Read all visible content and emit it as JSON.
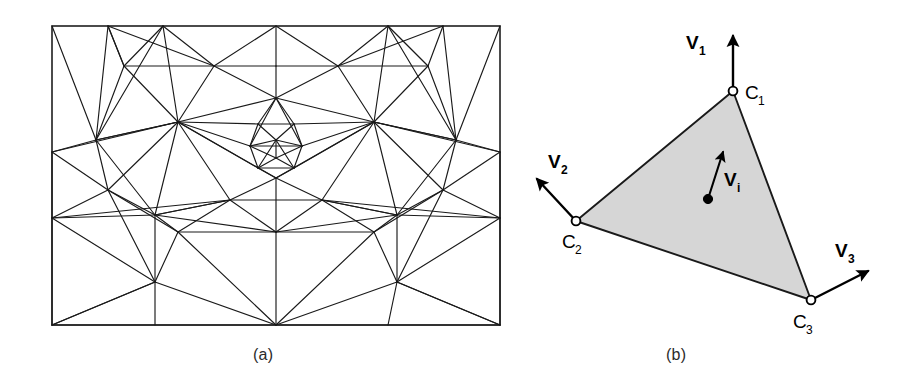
{
  "figure": {
    "background_color": "#ffffff",
    "line_color": "#1a1a1a",
    "fill_color": "#d6d6d6",
    "width": 913,
    "height": 380
  },
  "panel_a": {
    "caption": "(a)",
    "description": "adaptive triangular finite element mesh with refined central region",
    "border": {
      "x0": 52,
      "y0": 26,
      "x1": 500,
      "y1": 325
    },
    "mesh": {
      "type": "triangulation",
      "symmetry": "mirror about vertical center axis x=276",
      "nodes": [
        [
          52,
          26
        ],
        [
          108,
          26
        ],
        [
          163,
          26
        ],
        [
          276,
          26
        ],
        [
          388,
          26
        ],
        [
          443,
          26
        ],
        [
          500,
          26
        ],
        [
          124,
          66
        ],
        [
          214,
          66
        ],
        [
          276,
          66
        ],
        [
          338,
          66
        ],
        [
          428,
          66
        ],
        [
          52,
          152
        ],
        [
          96,
          140
        ],
        [
          178,
          122
        ],
        [
          276,
          98
        ],
        [
          374,
          122
        ],
        [
          456,
          140
        ],
        [
          500,
          152
        ],
        [
          258,
          124
        ],
        [
          294,
          124
        ],
        [
          250,
          146
        ],
        [
          302,
          146
        ],
        [
          276,
          140
        ],
        [
          258,
          168
        ],
        [
          294,
          168
        ],
        [
          276,
          158
        ],
        [
          276,
          178
        ],
        [
          52,
          218
        ],
        [
          108,
          190
        ],
        [
          155,
          215
        ],
        [
          230,
          200
        ],
        [
          322,
          200
        ],
        [
          397,
          215
        ],
        [
          443,
          190
        ],
        [
          500,
          218
        ],
        [
          178,
          232
        ],
        [
          276,
          232
        ],
        [
          374,
          232
        ],
        [
          155,
          282
        ],
        [
          276,
          325
        ],
        [
          397,
          282
        ],
        [
          52,
          325
        ],
        [
          155,
          325
        ],
        [
          388,
          325
        ],
        [
          500,
          325
        ]
      ],
      "edges_count": 148,
      "refined_center": {
        "cx": 276,
        "cy": 150,
        "levels": 3
      }
    }
  },
  "panel_b": {
    "caption": "(b)",
    "description": "shaded triangular element with corner nodes and velocity vectors",
    "triangle": {
      "vertices": [
        [
          733,
          91
        ],
        [
          576,
          221
        ],
        [
          811,
          300
        ]
      ],
      "fill": "#d6d6d6",
      "stroke": "#1a1a1a"
    },
    "corner_nodes": [
      {
        "id": "C1",
        "label": "C",
        "subscript": "1",
        "x": 733,
        "y": 91,
        "marker": "open-circle"
      },
      {
        "id": "C2",
        "label": "C",
        "subscript": "2",
        "x": 576,
        "y": 221,
        "marker": "open-circle"
      },
      {
        "id": "C3",
        "label": "C",
        "subscript": "3",
        "x": 811,
        "y": 300,
        "marker": "open-circle"
      }
    ],
    "interior_node": {
      "id": "Pi",
      "x": 708,
      "y": 199,
      "marker": "solid-dot"
    },
    "vectors": [
      {
        "id": "V1",
        "label": "V",
        "subscript": "1",
        "from": [
          733,
          91
        ],
        "to": [
          733,
          32
        ],
        "label_pos": [
          700,
          48
        ]
      },
      {
        "id": "V2",
        "label": "V",
        "subscript": "2",
        "from": [
          576,
          221
        ],
        "to": [
          533,
          174
        ],
        "label_pos": [
          548,
          158
        ]
      },
      {
        "id": "V3",
        "label": "V",
        "subscript": "3",
        "from": [
          811,
          300
        ],
        "to": [
          872,
          268
        ],
        "label_pos": [
          838,
          250
        ]
      },
      {
        "id": "Vi",
        "label": "V",
        "subscript": "i",
        "from": [
          708,
          199
        ],
        "to": [
          724,
          147
        ],
        "label_pos": [
          731,
          179
        ]
      }
    ]
  }
}
